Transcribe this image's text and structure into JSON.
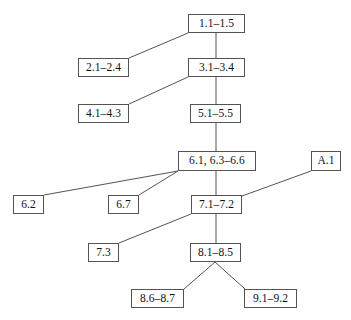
{
  "diagram": {
    "type": "dependency-tree",
    "background_color": "#ffffff",
    "node_border_color": "#54544f",
    "edge_color": "#54544f",
    "text_color": "#101010",
    "nodes": [
      {
        "id": "n1",
        "label": "1.1–1.5",
        "x": 188,
        "y": 14,
        "w": 57,
        "h": 19
      },
      {
        "id": "n2",
        "label": "2.1–2.4",
        "x": 78,
        "y": 58,
        "w": 51,
        "h": 19
      },
      {
        "id": "n3",
        "label": "3.1–3.4",
        "x": 188,
        "y": 58,
        "w": 57,
        "h": 19
      },
      {
        "id": "n4",
        "label": "4.1–4.3",
        "x": 78,
        "y": 104,
        "w": 51,
        "h": 19
      },
      {
        "id": "n5",
        "label": "5.1–5.5",
        "x": 190,
        "y": 104,
        "w": 51,
        "h": 19
      },
      {
        "id": "n6",
        "label": "6.1, 6.3–6.6",
        "x": 178,
        "y": 151,
        "w": 78,
        "h": 20
      },
      {
        "id": "na",
        "label": "A.1",
        "x": 311,
        "y": 151,
        "w": 30,
        "h": 20
      },
      {
        "id": "n62",
        "label": "6.2",
        "x": 13,
        "y": 195,
        "w": 31,
        "h": 19
      },
      {
        "id": "n67",
        "label": "6.7",
        "x": 108,
        "y": 195,
        "w": 31,
        "h": 19
      },
      {
        "id": "n7",
        "label": "7.1–7.2",
        "x": 191,
        "y": 195,
        "w": 51,
        "h": 19
      },
      {
        "id": "n73",
        "label": "7.3",
        "x": 88,
        "y": 243,
        "w": 31,
        "h": 19
      },
      {
        "id": "n8",
        "label": "8.1–8.5",
        "x": 190,
        "y": 243,
        "w": 51,
        "h": 19
      },
      {
        "id": "n86",
        "label": "8.6–8.7",
        "x": 131,
        "y": 289,
        "w": 53,
        "h": 19
      },
      {
        "id": "n91",
        "label": "9.1–9.2",
        "x": 244,
        "y": 289,
        "w": 53,
        "h": 19
      }
    ],
    "edges": [
      {
        "from": "n1",
        "to": "n2",
        "x1": 188,
        "y1": 33,
        "x2": 129,
        "y2": 58
      },
      {
        "from": "n1",
        "to": "n3",
        "x1": 216,
        "y1": 33,
        "x2": 216,
        "y2": 58
      },
      {
        "from": "n3",
        "to": "n4",
        "x1": 188,
        "y1": 77,
        "x2": 129,
        "y2": 104
      },
      {
        "from": "n3",
        "to": "n5",
        "x1": 216,
        "y1": 77,
        "x2": 216,
        "y2": 104
      },
      {
        "from": "n5",
        "to": "n6",
        "x1": 216,
        "y1": 123,
        "x2": 216,
        "y2": 151
      },
      {
        "from": "n6",
        "to": "n62",
        "x1": 178,
        "y1": 171,
        "x2": 44,
        "y2": 195
      },
      {
        "from": "n6",
        "to": "n67",
        "x1": 178,
        "y1": 171,
        "x2": 139,
        "y2": 195
      },
      {
        "from": "n6",
        "to": "n7",
        "x1": 216,
        "y1": 171,
        "x2": 216,
        "y2": 195
      },
      {
        "from": "na",
        "to": "n7",
        "x1": 311,
        "y1": 171,
        "x2": 242,
        "y2": 196
      },
      {
        "from": "n7",
        "to": "n73",
        "x1": 191,
        "y1": 214,
        "x2": 119,
        "y2": 243
      },
      {
        "from": "n7",
        "to": "n8",
        "x1": 216,
        "y1": 214,
        "x2": 216,
        "y2": 243
      },
      {
        "from": "n8",
        "to": "n86",
        "x1": 215,
        "y1": 262,
        "x2": 184,
        "y2": 289
      },
      {
        "from": "n8",
        "to": "n91",
        "x1": 215,
        "y1": 262,
        "x2": 245,
        "y2": 289
      }
    ]
  }
}
